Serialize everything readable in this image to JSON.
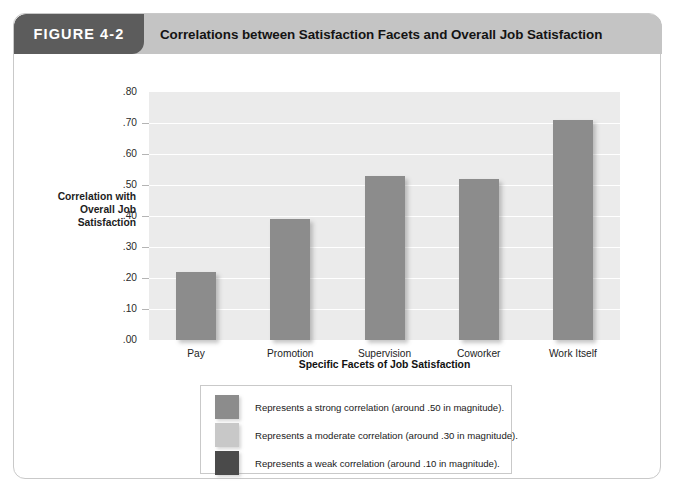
{
  "figure": {
    "badge_label": "FIGURE 4-2",
    "title": "Correlations between Satisfaction Facets and Overall Job Satisfaction",
    "badge_bg": "#5c5c5c",
    "title_bar_bg": "#c4c4c4"
  },
  "chart_data": {
    "type": "bar",
    "title": "Correlations between Satisfaction Facets and Overall Job Satisfaction",
    "xlabel": "Specific Facets of Job Satisfaction",
    "ylabel": "Correlation with Overall Job Satisfaction",
    "ylabel_lines": [
      "Correlation with",
      "Overall Job",
      "Satisfaction"
    ],
    "categories": [
      "Pay",
      "Promotion",
      "Supervision",
      "Coworker",
      "Work Itself"
    ],
    "values": [
      0.22,
      0.39,
      0.53,
      0.52,
      0.71
    ],
    "ylim": [
      0.0,
      0.8
    ],
    "ytick_labels": [
      ".00",
      ".10",
      ".20",
      ".30",
      ".40",
      ".50",
      ".60",
      ".70",
      ".80"
    ],
    "ytick_values": [
      0.0,
      0.1,
      0.2,
      0.3,
      0.4,
      0.5,
      0.6,
      0.7,
      0.8
    ],
    "grid": true,
    "legend_position": "below",
    "bar_color": "#8c8c8c",
    "plot_bg": "#ebebeb",
    "gridline_color": "#ffffff"
  },
  "legend": {
    "items": [
      {
        "swatch_color": "#8c8c8c",
        "label": "Represents a strong correlation (around .50 in magnitude)."
      },
      {
        "swatch_color": "#c8c8c8",
        "label": "Represents a moderate correlation (around .30 in magnitude)."
      },
      {
        "swatch_color": "#4a4a4a",
        "label": "Represents a weak correlation (around .10 in magnitude)."
      }
    ]
  }
}
